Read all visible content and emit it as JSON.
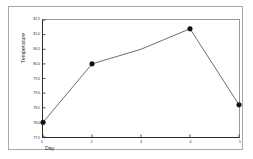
{
  "chart_data": {
    "type": "line",
    "title": "",
    "xlabel": "Day",
    "ylabel": "Temperature",
    "x": [
      1,
      2,
      3,
      4,
      5
    ],
    "values": [
      78.0,
      80.0,
      80.5,
      81.2,
      78.6
    ],
    "categories": [
      "1",
      "2",
      "3",
      "4",
      "5"
    ],
    "series": [
      {
        "name": "Temperature",
        "values": [
          78.0,
          80.0,
          80.5,
          81.2,
          78.6
        ]
      }
    ],
    "xlim": [
      1,
      5
    ],
    "ylim": [
      77.5,
      81.5
    ],
    "xticks": [
      1,
      2,
      3,
      4,
      5
    ],
    "xtick_labels": [
      "1",
      "2",
      "3",
      "4",
      "5"
    ],
    "yticks": [
      77.5,
      78.0,
      78.5,
      79.0,
      79.5,
      80.0,
      80.5,
      81.0,
      81.5
    ],
    "ytick_labels": [
      "77.5",
      "78.0",
      "78.5",
      "79.0",
      "79.5",
      "80.0",
      "80.5",
      "81.0",
      "81.5"
    ],
    "grid": false,
    "legend": false,
    "legend_position": "none",
    "marker": "filled-circle",
    "line_color": "#3a3a3a",
    "marker_color": "#111111",
    "markers_shown_at": [
      1,
      2,
      4,
      5
    ],
    "background_color": "#ffffff",
    "frame_color": "#a8a8a8",
    "axis_color": "#2b2b2b"
  }
}
